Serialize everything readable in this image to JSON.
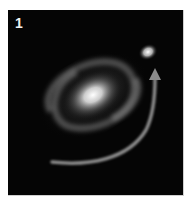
{
  "figure": {
    "panel_label": "1",
    "colors": {
      "background": "#050505",
      "galaxy_core": "#ffffff",
      "arrow": "#8a8a8a"
    },
    "icons": [
      "spiral-galaxy",
      "companion-galaxy",
      "curved-arrow"
    ]
  }
}
